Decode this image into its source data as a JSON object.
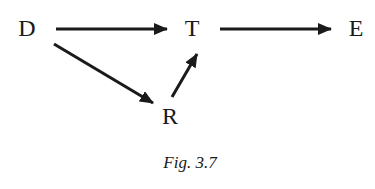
{
  "diagram": {
    "type": "directed-graph",
    "nodes": [
      {
        "id": "D",
        "label": "D",
        "x": 27,
        "y": 36
      },
      {
        "id": "T",
        "label": "T",
        "x": 192,
        "y": 36
      },
      {
        "id": "E",
        "label": "E",
        "x": 356,
        "y": 36
      },
      {
        "id": "R",
        "label": "R",
        "x": 170,
        "y": 124
      }
    ],
    "edges": [
      {
        "from": "D",
        "to": "T"
      },
      {
        "from": "T",
        "to": "E"
      },
      {
        "from": "D",
        "to": "R"
      },
      {
        "from": "R",
        "to": "T"
      }
    ],
    "caption": "Fig. 3.7",
    "colors": {
      "ink": "#1a1a1a",
      "background": "#ffffff"
    }
  }
}
